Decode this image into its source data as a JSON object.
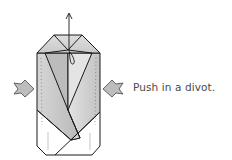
{
  "diagram": {
    "type": "origami-fold-step",
    "instruction": "Push in a divot.",
    "colors": {
      "outline": "#1a1a1a",
      "paper_shade": "#c8c8c8",
      "paper_light": "#e6e6e6",
      "background": "#ffffff",
      "arrow_fill": "#bdbdbd",
      "text": "#4a4a4a"
    },
    "icons": [
      "push-arrow-left",
      "push-arrow-right",
      "lift-arrow-up"
    ]
  }
}
